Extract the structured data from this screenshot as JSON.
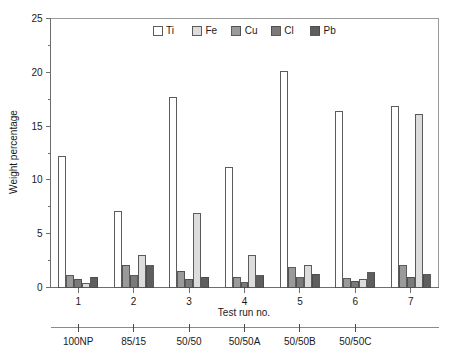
{
  "chart_data": {
    "type": "bar",
    "title": "",
    "xlabel": "Test run no.",
    "ylabel": "Weight percentage",
    "ylim": [
      0,
      25
    ],
    "yticks": [
      0,
      5,
      10,
      15,
      20,
      25
    ],
    "ytick_labels": [
      "0",
      "5",
      "10",
      "15",
      "20",
      "25"
    ],
    "yminor_ticks": [
      2.5,
      7.5,
      12.5,
      17.5,
      22.5
    ],
    "grid": false,
    "legend_position": "top-center",
    "categories": [
      "1",
      "2",
      "3",
      "4",
      "5",
      "6",
      "7"
    ],
    "series": [
      {
        "name": "Ti",
        "color": "#ffffff",
        "values": [
          12.2,
          7.05,
          17.7,
          11.15,
          20.05,
          16.4,
          16.85
        ]
      },
      {
        "name": "Fe",
        "color": "#dcdcdc",
        "values": [
          0.35,
          3.0,
          6.85,
          2.95,
          2.05,
          0.75,
          16.1
        ]
      },
      {
        "name": "Cu",
        "color": "#9a9a9a",
        "values": [
          1.1,
          2.05,
          1.5,
          0.95,
          1.85,
          0.8,
          2.0
        ]
      },
      {
        "name": "Cl",
        "color": "#7a7a7a",
        "values": [
          0.75,
          1.1,
          0.75,
          0.45,
          0.9,
          0.6,
          0.95
        ]
      },
      {
        "name": "Pb",
        "color": "#5e5e5e",
        "values": [
          0.95,
          2.0,
          0.95,
          1.1,
          1.25,
          1.35,
          1.2
        ]
      }
    ],
    "bar_draw_order": [
      "Ti",
      "Cu",
      "Cl",
      "Fe",
      "Pb"
    ],
    "secondary_axis": {
      "label_groups": [
        "100NP",
        "85/15",
        "50/50",
        "50/50A",
        "50/50B",
        "50/50C"
      ],
      "tick_at_categories": [
        "1",
        "2",
        "3",
        "4",
        "5",
        "6"
      ]
    }
  },
  "legend": {
    "entries": [
      {
        "label": "Ti",
        "swatch": "#ffffff"
      },
      {
        "label": "Fe",
        "swatch": "#dcdcdc"
      },
      {
        "label": "Cu",
        "swatch": "#9a9a9a"
      },
      {
        "label": "Cl",
        "swatch": "#7a7a7a"
      },
      {
        "label": "Pb",
        "swatch": "#5e5e5e"
      }
    ]
  },
  "axes": {
    "y_title": "Weight percentage",
    "x_title": "Test run no."
  },
  "colors": {
    "axis": "#6e6e6e",
    "frame": "#9a9a9a",
    "bar_stroke": "#4a4a4a",
    "text": "#1a1a1a",
    "background": "#ffffff"
  }
}
